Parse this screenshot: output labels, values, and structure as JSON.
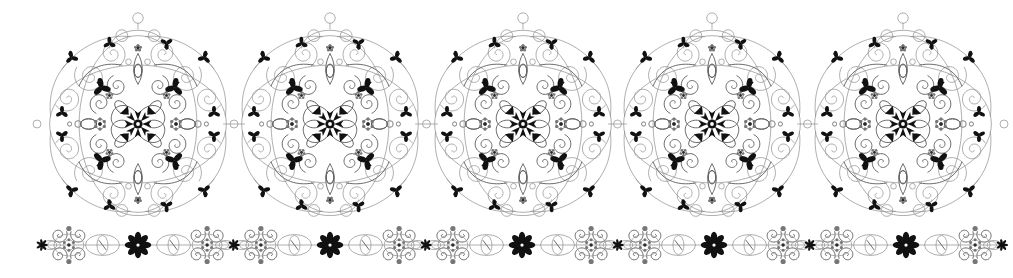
{
  "artwork": {
    "title": "Ornamental Filigree Medallion Band",
    "kind": "decorative-vector-ornament",
    "canvas": {
      "width": 1013,
      "height": 278
    },
    "background_color": "#ffffff",
    "palette": {
      "line_light": "#8d8d8d",
      "line_mid": "#5a5a5a",
      "line_dark": "#2b2b2b",
      "accent_black": "#111111",
      "dot_gray": "#777777"
    },
    "stroke_widths": {
      "hairline": 0.7,
      "thin": 0.9,
      "medium": 1.2
    }
  },
  "medallion_band": {
    "count": 5,
    "center_y": 124,
    "radius": 95,
    "centers_x": [
      138,
      330,
      523,
      712,
      903
    ],
    "finial_top_y": 18,
    "finial_radius": 5,
    "connector": {
      "present": true,
      "ring_radius": 4,
      "y": 124
    },
    "features": [
      "outer-spiral-corners",
      "black-trefoil-accents",
      "dotted-rosettes",
      "dense-black-central-star",
      "four-fold-symmetry"
    ]
  },
  "border_strip": {
    "count": 5,
    "center_y": 245,
    "unit_width": 192,
    "start_x": 42,
    "features": [
      "spiral-knot-clusters",
      "dotted-rosette-hubs",
      "leaf-eye-lens-shapes",
      "central-black-eight-petal-flower",
      "top-and-bottom-dot-finials"
    ]
  },
  "labels": {
    "canvas": "ornament-canvas",
    "medallion": "filigree-medallion",
    "strip": "filigree-border-strip"
  }
}
